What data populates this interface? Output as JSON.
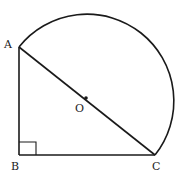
{
  "diagram": {
    "type": "geometry",
    "colors": {
      "stroke": "#1a1a1a",
      "label": "#222222",
      "background": "#ffffff"
    },
    "points": {
      "A": {
        "label": "A",
        "x": 19,
        "y": 47
      },
      "B": {
        "label": "B",
        "x": 19,
        "y": 155
      },
      "C": {
        "label": "C",
        "x": 155,
        "y": 155
      },
      "O": {
        "label": "O",
        "x": 87,
        "y": 101
      }
    },
    "segments": [
      {
        "from": "A",
        "to": "B"
      },
      {
        "from": "B",
        "to": "C"
      },
      {
        "from": "A",
        "to": "C"
      }
    ],
    "arc": {
      "center": "O",
      "from": "A",
      "to": "C",
      "radius": 87
    },
    "right_angle_marker": {
      "at": "B",
      "size": 17
    }
  }
}
